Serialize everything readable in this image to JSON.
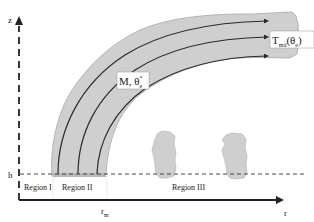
{
  "diagram": {
    "type": "plume-schematic",
    "axes": {
      "vertical_label": "z",
      "horizontal_label": "r",
      "height_marker": "h",
      "radius_marker_main": "r",
      "radius_marker_sub": "m"
    },
    "regions": [
      {
        "label": "Region I"
      },
      {
        "label": "Region II"
      },
      {
        "label": "Region III"
      }
    ],
    "annotations": {
      "plume_label_main": "M, θ",
      "plume_label_sup": "*",
      "plume_label_sub": "e",
      "outflow_label_main": "T",
      "outflow_label_sub": "md",
      "outflow_label_arg_open": "(θ",
      "outflow_label_arg_sub": "e",
      "outflow_label_arg_close": ")"
    },
    "colors": {
      "plume_fill": "#cfcfcf",
      "plume_edge": "#9a9a9a",
      "streamline": "#2a2a2a",
      "axis": "#222222",
      "label_box": "#ffffff"
    },
    "streamline_count": 3,
    "detached_puffs": 2
  }
}
